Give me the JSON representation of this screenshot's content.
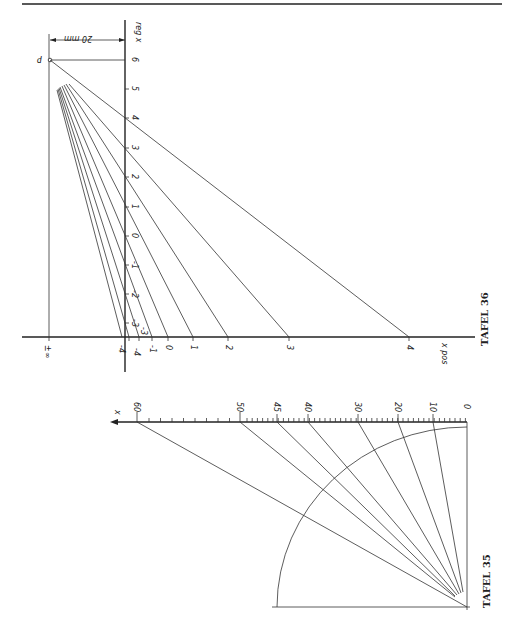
{
  "page": {
    "header_rule": true
  },
  "tafel36": {
    "caption": "TAFEL 36",
    "dimension_label": "20 mm",
    "point_label": "P",
    "vertical_axis_label": "reg x",
    "horizontal_axis_label": "x pos",
    "vertical_ticks": [
      {
        "label": "6",
        "y": 60
      },
      {
        "label": "5",
        "y": 89
      },
      {
        "label": "4",
        "y": 118
      },
      {
        "label": "3",
        "y": 148
      },
      {
        "label": "2",
        "y": 177
      },
      {
        "label": "1",
        "y": 207
      },
      {
        "label": "0",
        "y": 236
      },
      {
        "label": "-1",
        "y": 265
      },
      {
        "label": "-2",
        "y": 294
      },
      {
        "label": "-3",
        "y": 323
      }
    ],
    "horizontal_ticks": [
      {
        "label": "±∞",
        "x": 48
      },
      {
        "label": "-4",
        "x": 122
      },
      {
        "label": "-4",
        "x": 129
      },
      {
        "label": "-3",
        "x": 139
      },
      {
        "label": "-1",
        "x": 152
      },
      {
        "label": "0",
        "x": 168
      },
      {
        "label": "1",
        "x": 193
      },
      {
        "label": "2",
        "x": 228
      },
      {
        "label": "3",
        "x": 289
      },
      {
        "label": "4",
        "x": 409
      }
    ]
  },
  "tafel35": {
    "caption": "TAFEL 35",
    "axis_label": "x",
    "scale_ticks": [
      {
        "label": "60",
        "x": 137
      },
      {
        "label": "50",
        "x": 240
      },
      {
        "label": "45",
        "x": 277
      },
      {
        "label": "40",
        "x": 308
      },
      {
        "label": "30",
        "x": 358
      },
      {
        "label": "20",
        "x": 398
      },
      {
        "label": "10",
        "x": 433
      },
      {
        "label": "0",
        "x": 467
      }
    ]
  }
}
